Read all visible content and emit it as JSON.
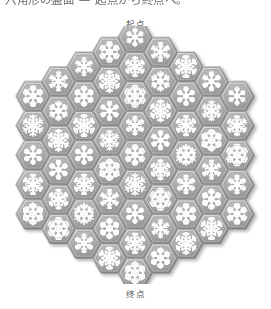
{
  "page": {
    "background": "#ffffff",
    "width": 271,
    "height": 309,
    "clipped_top_text": "六角形の盤面 — 起点から終点へ。"
  },
  "labels": {
    "start": "起点",
    "end": "终点"
  },
  "figure": {
    "name": "hexagonal-snowflake-board",
    "tile_motif": "snowflake",
    "tile_shape": "flat-top-hexagon",
    "board_shape": "hexagon",
    "board_radius_rings": 4,
    "columns": [
      5,
      6,
      7,
      8,
      9,
      8,
      7,
      6,
      5
    ],
    "tile_count": 61,
    "colors": {
      "board_fill": "#9b9b9b",
      "tile_fill": "#a8a8a8",
      "tile_inner": "#bdbdbd",
      "motif": "#ffffff",
      "bevel_light": "#e2e2e2",
      "bevel_dark": "#6e6e6e",
      "shadow": "#c9c9c9",
      "outline": "#7a7a7a",
      "text": "#4d4d4d"
    },
    "geometry": {
      "tile_radius": 17.0,
      "center_x": 135.0,
      "center_y": 129.0
    }
  }
}
